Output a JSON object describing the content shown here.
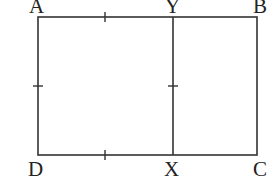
{
  "diagram": {
    "type": "geometry",
    "stroke_color": "#333333",
    "background": "#ffffff",
    "labels": {
      "A": "A",
      "B": "B",
      "C": "C",
      "D": "D",
      "X": "X",
      "Y": "Y"
    },
    "points": {
      "A": [
        38,
        17
      ],
      "B": [
        257,
        17
      ],
      "C": [
        257,
        155
      ],
      "D": [
        38,
        155
      ],
      "Y": [
        173,
        17
      ],
      "X": [
        173,
        155
      ]
    },
    "segments": [
      [
        "A",
        "B"
      ],
      [
        "B",
        "C"
      ],
      [
        "C",
        "D"
      ],
      [
        "D",
        "A"
      ],
      [
        "Y",
        "X"
      ]
    ],
    "tick_marks": [
      {
        "on": "AY",
        "at": [
          105,
          17
        ],
        "orientation": "vertical"
      },
      {
        "on": "DX",
        "at": [
          105,
          155
        ],
        "orientation": "vertical"
      },
      {
        "on": "AD",
        "at": [
          38,
          86
        ],
        "orientation": "horizontal"
      },
      {
        "on": "YX",
        "at": [
          173,
          86
        ],
        "orientation": "horizontal"
      }
    ]
  }
}
